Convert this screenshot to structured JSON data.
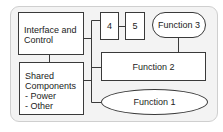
{
  "diagram": {
    "type": "block-diagram",
    "blocks": {
      "interface": {
        "line1": "Interface and",
        "line2": "Control"
      },
      "shared": {
        "line1": "Shared",
        "line2": "Components",
        "items": [
          "- Power",
          "- Other"
        ]
      },
      "box4": {
        "label": "4"
      },
      "box5": {
        "label": "5"
      },
      "function3": {
        "label": "Function 3"
      },
      "function2": {
        "label": "Function 2"
      },
      "function1": {
        "label": "Function 1"
      }
    },
    "connections": [
      [
        "interface",
        "shared"
      ],
      [
        "interface",
        "trunk"
      ],
      [
        "trunk",
        "box4"
      ],
      [
        "box4",
        "box5"
      ],
      [
        "trunk",
        "function2"
      ],
      [
        "trunk",
        "function1"
      ],
      [
        "shared",
        "trunk"
      ],
      [
        "function3",
        "function2"
      ]
    ],
    "colors": {
      "background": "#f3f3f3",
      "border": "#3a3a3a",
      "box_fill": "#ffffff",
      "container_border": "#cfcfcf"
    }
  }
}
